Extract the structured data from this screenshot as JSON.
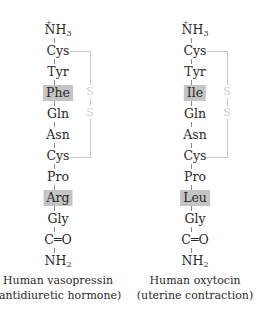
{
  "molecules": [
    {
      "name": "Human vasopressin",
      "function": "(antidiuretic hormone)",
      "n_terminus": "NH3",
      "n_terminus_charge": "+",
      "residues": [
        "Cys",
        "Tyr",
        "Phe",
        "Gln",
        "Asn",
        "Cys",
        "Pro",
        "Arg",
        "Gly"
      ],
      "highlighted": [
        "Phe",
        "Arg"
      ],
      "carbonyl": "C=O",
      "c_terminus": "NH2",
      "disulfide": [
        "S",
        "S"
      ]
    },
    {
      "name": "Human oxytocin",
      "function": "(uterine contraction)",
      "n_terminus": "NH3",
      "n_terminus_charge": "+",
      "residues": [
        "Cys",
        "Tyr",
        "Ile",
        "Gln",
        "Asn",
        "Cys",
        "Pro",
        "Leu",
        "Gly"
      ],
      "highlighted": [
        "Ile",
        "Leu"
      ],
      "carbonyl": "C=O",
      "c_terminus": "NH2",
      "disulfide": [
        "S",
        "S"
      ]
    }
  ],
  "colors": {
    "highlight": "#c4c4c4",
    "bridge": "#c8c8c8",
    "text": "#2a2a2a"
  }
}
